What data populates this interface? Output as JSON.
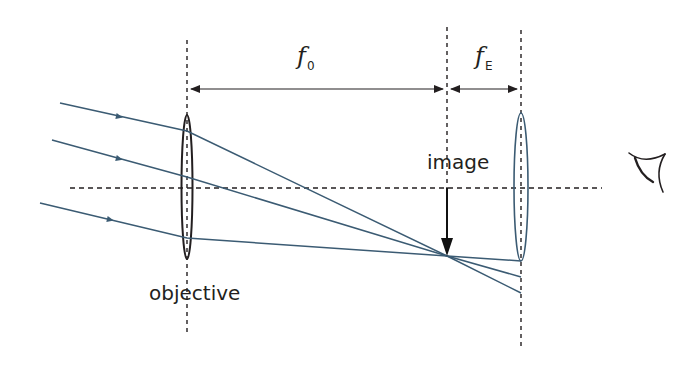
{
  "diagram": {
    "colors": {
      "ray": "#3b5b73",
      "line": "#231f20",
      "lens": "#231f20",
      "eyepiece_lens": "#3b5b73",
      "background": "#ffffff"
    },
    "labels": {
      "objective_focal_symbol": "f",
      "objective_focal_subscript": "0",
      "eyepiece_focal_symbol": "f",
      "eyepiece_focal_subscript": "E",
      "image": "image",
      "objective": "objective"
    },
    "elements": {
      "optical_axis": "dashed horizontal line",
      "objective_lens": "thin convex lens",
      "eyepiece_lens": "thin convex lens",
      "image_arrow": "inverted image arrow",
      "eye": "eye-icon",
      "rays": 3
    }
  }
}
